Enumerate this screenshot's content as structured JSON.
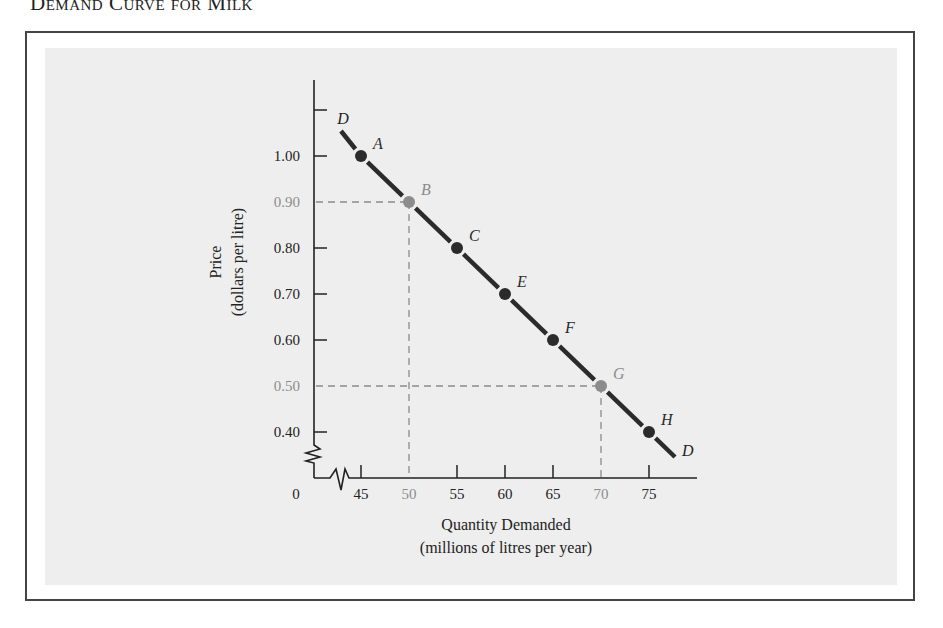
{
  "figure": {
    "title": "Demand Curve for Milk"
  },
  "chart_data": {
    "type": "line",
    "title": "Demand Curve for Milk",
    "xlabel": "Quantity Demanded",
    "xlabel_sub": "(millions of litres per year)",
    "ylabel": "Price",
    "ylabel_sub": "(dollars per litre)",
    "x_ticks": [
      "0",
      "45",
      "50",
      "55",
      "60",
      "65",
      "70",
      "75"
    ],
    "y_ticks": [
      "0.40",
      "0.50",
      "0.60",
      "0.70",
      "0.80",
      "0.90",
      "1.00"
    ],
    "xlim": [
      45,
      77
    ],
    "ylim": [
      0.35,
      1.12
    ],
    "axis_breaks": {
      "x": true,
      "y": true
    },
    "grid": false,
    "curve_label": "D",
    "series": [
      {
        "name": "D",
        "points": [
          {
            "label": "A",
            "x": 45,
            "y": 1.0,
            "highlight": false
          },
          {
            "label": "B",
            "x": 50,
            "y": 0.9,
            "highlight": true
          },
          {
            "label": "C",
            "x": 55,
            "y": 0.8,
            "highlight": false
          },
          {
            "label": "E",
            "x": 60,
            "y": 0.7,
            "highlight": false
          },
          {
            "label": "F",
            "x": 65,
            "y": 0.6,
            "highlight": false
          },
          {
            "label": "G",
            "x": 70,
            "y": 0.5,
            "highlight": true
          },
          {
            "label": "H",
            "x": 75,
            "y": 0.4,
            "highlight": false
          }
        ]
      }
    ],
    "reference_lines": [
      {
        "point": "B",
        "x": 50,
        "y": 0.9
      },
      {
        "point": "G",
        "x": 70,
        "y": 0.5
      }
    ],
    "colors": {
      "curve": "#2b2b2b",
      "highlight": "#8c8c8c",
      "background": "#eeeeee",
      "frame": "#444444"
    }
  }
}
